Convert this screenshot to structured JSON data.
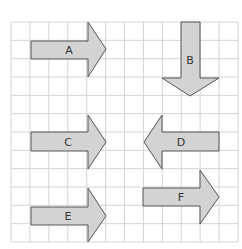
{
  "grid": {
    "cols": 12,
    "rows": 12,
    "line_color": "#d4d4d4"
  },
  "arrow_style": {
    "fill": "#d3d3d3",
    "stroke": "#555555"
  },
  "arrows": [
    {
      "label": "A",
      "direction": "right",
      "points": "31,41 88,41 88,22 106,49 88,77 88,59 31,59",
      "lx": 69,
      "ly": 54
    },
    {
      "label": "B",
      "direction": "down",
      "points": "181,22 200,22 200,78 219,78 190,96 162,78 181,78",
      "lx": 190,
      "ly": 64
    },
    {
      "label": "C",
      "direction": "right",
      "points": "31,132 88,132 88,115 106,142 88,169 88,151 31,151",
      "lx": 68,
      "ly": 146
    },
    {
      "label": "D",
      "direction": "left",
      "points": "219,132 162,132 162,115 144,142 162,169 162,151 219,151",
      "lx": 181,
      "ly": 146
    },
    {
      "label": "E",
      "direction": "right",
      "points": "31,207 88,207 88,188 106,216 88,242 88,225 31,225",
      "lx": 68,
      "ly": 220
    },
    {
      "label": "F",
      "direction": "right",
      "points": "143,188 200,188 200,170 219,197 200,224 200,206 143,206",
      "lx": 181,
      "ly": 201
    }
  ]
}
